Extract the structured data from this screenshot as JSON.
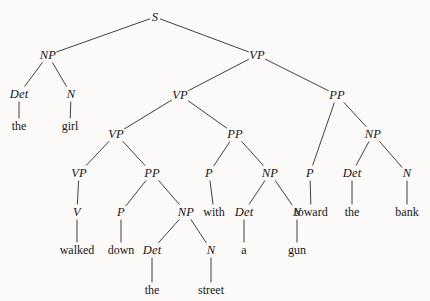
{
  "figure": {
    "type": "syntax-parse-tree",
    "sentence": "the girl walked down the street with a gun toward the bank",
    "background_color": "#fbfaf8",
    "text_color": "#16161a",
    "line_color": "#2b2b2f"
  },
  "nodes": [
    {
      "id": "n0",
      "label": "S",
      "kind": "nonterminal",
      "x": 155,
      "y": 17
    },
    {
      "id": "n1",
      "label": "NP",
      "kind": "nonterminal",
      "x": 48,
      "y": 55
    },
    {
      "id": "n2",
      "label": "VP",
      "kind": "nonterminal",
      "x": 257,
      "y": 55
    },
    {
      "id": "n3",
      "label": "Det",
      "kind": "nonterminal",
      "x": 19,
      "y": 94
    },
    {
      "id": "n4",
      "label": "N",
      "kind": "nonterminal",
      "x": 71,
      "y": 94
    },
    {
      "id": "n5",
      "label": "the",
      "kind": "terminal",
      "x": 19,
      "y": 126
    },
    {
      "id": "n6",
      "label": "girl",
      "kind": "terminal",
      "x": 70,
      "y": 126
    },
    {
      "id": "n7",
      "label": "VP",
      "kind": "nonterminal",
      "x": 180,
      "y": 95
    },
    {
      "id": "n8",
      "label": "PP",
      "kind": "nonterminal",
      "x": 337,
      "y": 95
    },
    {
      "id": "n9",
      "label": "VP",
      "kind": "nonterminal",
      "x": 116,
      "y": 134
    },
    {
      "id": "n10",
      "label": "PP",
      "kind": "nonterminal",
      "x": 235,
      "y": 134
    },
    {
      "id": "n11",
      "label": "P",
      "kind": "nonterminal",
      "x": 310,
      "y": 173
    },
    {
      "id": "n12",
      "label": "NP",
      "kind": "nonterminal",
      "x": 373,
      "y": 134
    },
    {
      "id": "n13",
      "label": "VP",
      "kind": "nonterminal",
      "x": 79,
      "y": 173
    },
    {
      "id": "n14",
      "label": "PP",
      "kind": "nonterminal",
      "x": 152,
      "y": 173
    },
    {
      "id": "n15",
      "label": "P",
      "kind": "nonterminal",
      "x": 209,
      "y": 173
    },
    {
      "id": "n16",
      "label": "NP",
      "kind": "nonterminal",
      "x": 270,
      "y": 173
    },
    {
      "id": "n17",
      "label": "toward",
      "kind": "terminal",
      "x": 311,
      "y": 212
    },
    {
      "id": "n18",
      "label": "Det",
      "kind": "nonterminal",
      "x": 352,
      "y": 173
    },
    {
      "id": "n19",
      "label": "N",
      "kind": "nonterminal",
      "x": 407,
      "y": 173
    },
    {
      "id": "n20",
      "label": "the",
      "kind": "terminal",
      "x": 352,
      "y": 212
    },
    {
      "id": "n21",
      "label": "bank",
      "kind": "terminal",
      "x": 407,
      "y": 212
    },
    {
      "id": "n22",
      "label": "V",
      "kind": "nonterminal",
      "x": 77,
      "y": 212
    },
    {
      "id": "n23",
      "label": "P",
      "kind": "nonterminal",
      "x": 121,
      "y": 212
    },
    {
      "id": "n24",
      "label": "NP",
      "kind": "nonterminal",
      "x": 186,
      "y": 212
    },
    {
      "id": "n25",
      "label": "with",
      "kind": "terminal",
      "x": 214,
      "y": 212
    },
    {
      "id": "n26",
      "label": "Det",
      "kind": "nonterminal",
      "x": 244,
      "y": 212
    },
    {
      "id": "n27",
      "label": "N",
      "kind": "nonterminal",
      "x": 297,
      "y": 212
    },
    {
      "id": "n28",
      "label": "a",
      "kind": "terminal",
      "x": 244,
      "y": 250
    },
    {
      "id": "n29",
      "label": "gun",
      "kind": "terminal",
      "x": 297,
      "y": 250
    },
    {
      "id": "n30",
      "label": "walked",
      "kind": "terminal",
      "x": 77,
      "y": 250
    },
    {
      "id": "n31",
      "label": "down",
      "kind": "terminal",
      "x": 121,
      "y": 250
    },
    {
      "id": "n32",
      "label": "Det",
      "kind": "nonterminal",
      "x": 152,
      "y": 250
    },
    {
      "id": "n33",
      "label": "N",
      "kind": "nonterminal",
      "x": 211,
      "y": 250
    },
    {
      "id": "n34",
      "label": "the",
      "kind": "terminal",
      "x": 152,
      "y": 290
    },
    {
      "id": "n35",
      "label": "street",
      "kind": "terminal",
      "x": 211,
      "y": 290
    }
  ],
  "edges": [
    {
      "from": "n0",
      "to": "n1"
    },
    {
      "from": "n0",
      "to": "n2"
    },
    {
      "from": "n1",
      "to": "n3"
    },
    {
      "from": "n1",
      "to": "n4"
    },
    {
      "from": "n3",
      "to": "n5"
    },
    {
      "from": "n4",
      "to": "n6"
    },
    {
      "from": "n2",
      "to": "n7"
    },
    {
      "from": "n2",
      "to": "n8"
    },
    {
      "from": "n7",
      "to": "n9"
    },
    {
      "from": "n7",
      "to": "n10"
    },
    {
      "from": "n8",
      "to": "n11"
    },
    {
      "from": "n8",
      "to": "n12"
    },
    {
      "from": "n9",
      "to": "n13"
    },
    {
      "from": "n9",
      "to": "n14"
    },
    {
      "from": "n10",
      "to": "n15"
    },
    {
      "from": "n10",
      "to": "n16"
    },
    {
      "from": "n11",
      "to": "n17"
    },
    {
      "from": "n12",
      "to": "n18"
    },
    {
      "from": "n12",
      "to": "n19"
    },
    {
      "from": "n18",
      "to": "n20"
    },
    {
      "from": "n19",
      "to": "n21"
    },
    {
      "from": "n13",
      "to": "n22"
    },
    {
      "from": "n14",
      "to": "n23"
    },
    {
      "from": "n14",
      "to": "n24"
    },
    {
      "from": "n15",
      "to": "n25"
    },
    {
      "from": "n16",
      "to": "n26"
    },
    {
      "from": "n16",
      "to": "n27"
    },
    {
      "from": "n26",
      "to": "n28"
    },
    {
      "from": "n27",
      "to": "n29"
    },
    {
      "from": "n22",
      "to": "n30"
    },
    {
      "from": "n23",
      "to": "n31"
    },
    {
      "from": "n24",
      "to": "n32"
    },
    {
      "from": "n24",
      "to": "n33"
    },
    {
      "from": "n32",
      "to": "n34"
    },
    {
      "from": "n33",
      "to": "n35"
    }
  ]
}
